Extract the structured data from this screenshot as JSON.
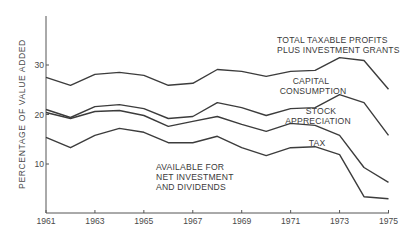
{
  "chart_data": {
    "type": "line",
    "title": "",
    "xlabel": "",
    "ylabel": "PERCENTAGE OF VALUE ADDED",
    "x": [
      1961,
      1962,
      1963,
      1964,
      1965,
      1966,
      1967,
      1968,
      1969,
      1970,
      1971,
      1972,
      1973,
      1974,
      1975
    ],
    "x_tick_labels": [
      "1961",
      "1963",
      "1965",
      "1967",
      "1969",
      "1971",
      "1973",
      "1975"
    ],
    "y_tick_labels": [
      "10",
      "20",
      "30"
    ],
    "ylim": [
      0,
      40
    ],
    "xlim": [
      1961,
      1975
    ],
    "grid": false,
    "series": [
      {
        "name": "TOTAL TAXABLE PROFITS PLUS INVESTMENT GRANTS",
        "values": [
          27.5,
          25.9,
          28.1,
          28.5,
          27.9,
          25.9,
          26.3,
          29.1,
          28.7,
          27.7,
          28.7,
          28.9,
          31.5,
          30.9,
          25.1
        ]
      },
      {
        "name": "CAPITAL CONSUMPTION",
        "values": [
          21.0,
          19.4,
          21.6,
          22.0,
          21.2,
          19.2,
          19.6,
          22.4,
          21.4,
          19.8,
          21.2,
          21.4,
          24.0,
          22.4,
          15.8
        ]
      },
      {
        "name": "STOCK APPRECIATION",
        "values": [
          20.4,
          19.2,
          20.6,
          20.8,
          19.8,
          17.6,
          18.6,
          19.6,
          18.0,
          16.6,
          18.2,
          17.8,
          15.8,
          9.3,
          6.3
        ]
      },
      {
        "name": "TAX",
        "values": [
          15.4,
          13.3,
          15.8,
          17.2,
          16.4,
          14.3,
          14.3,
          15.6,
          13.3,
          11.7,
          13.3,
          13.5,
          11.9,
          3.4,
          3.0
        ]
      }
    ],
    "annotations": [
      {
        "text": [
          "TOTAL TAXABLE PROFITS",
          "PLUS INVESTMENT GRANTS"
        ],
        "region": "above top line"
      },
      {
        "text": [
          "CAPITAL",
          "CONSUMPTION"
        ],
        "region": "between line 1 and line 2"
      },
      {
        "text": [
          "STOCK",
          "APPRECIATION"
        ],
        "region": "between line 2 and line 3"
      },
      {
        "text": [
          "TAX"
        ],
        "region": "between line 3 and line 4"
      },
      {
        "text": [
          "AVAILABLE FOR",
          "NET INVESTMENT",
          "AND DIVIDENDS"
        ],
        "region": "below bottom line"
      }
    ],
    "legend": "none (inline annotations)"
  },
  "labels": {
    "ylabel": "PERCENTAGE OF VALUE ADDED",
    "total_line1": "TOTAL TAXABLE PROFITS",
    "total_line2": "PLUS INVESTMENT GRANTS",
    "capital_line1": "CAPITAL",
    "capital_line2": "CONSUMPTION",
    "stock_line1": "STOCK",
    "stock_line2": "APPRECIATION",
    "tax": "TAX",
    "avail_line1": "AVAILABLE FOR",
    "avail_line2": "NET INVESTMENT",
    "avail_line3": "AND DIVIDENDS"
  },
  "style": {
    "line_color": "#3c3c3c",
    "axis_color": "#555555"
  }
}
